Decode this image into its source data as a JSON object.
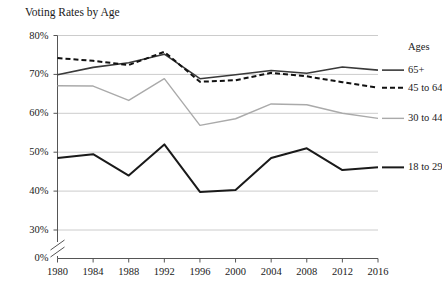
{
  "chart_data": {
    "type": "line",
    "title": "Voting Rates by Age",
    "xlabel": "",
    "ylabel": "",
    "x": [
      1980,
      1984,
      1988,
      1992,
      1996,
      2000,
      2004,
      2008,
      2012,
      2016
    ],
    "categories": [
      "1980",
      "1984",
      "1988",
      "1992",
      "1996",
      "2000",
      "2004",
      "2008",
      "2012",
      "2016"
    ],
    "xtick_labels": [
      "1980",
      "1984",
      "1988",
      "1992",
      "1996",
      "2000",
      "2004",
      "2008",
      "2012",
      "2016"
    ],
    "ytick_labels": [
      "0%",
      "30%",
      "40%",
      "50%",
      "60%",
      "70%",
      "80%"
    ],
    "ytick_values": [
      0,
      30,
      40,
      50,
      60,
      70,
      80
    ],
    "ylim": [
      30,
      80
    ],
    "xlim": [
      1980,
      2016
    ],
    "axis_break": true,
    "axis_break_note": "y-axis broken between 0% and 30%",
    "grid": "horizontal",
    "legend_position": "right",
    "legend_title": "Ages",
    "series": [
      {
        "name": "65+",
        "style": "solid",
        "color": "#3a3a3a",
        "values": [
          69.9,
          71.8,
          73.0,
          75.2,
          68.9,
          69.9,
          71.0,
          70.3,
          71.9,
          71.1
        ]
      },
      {
        "name": "45 to 64",
        "style": "dashed",
        "color": "#111111",
        "values": [
          74.2,
          73.5,
          72.4,
          75.8,
          68.1,
          68.5,
          70.4,
          69.5,
          68.0,
          66.6
        ]
      },
      {
        "name": "30 to 44",
        "style": "solid",
        "color": "#aaaaaa",
        "values": [
          67.1,
          67.0,
          63.3,
          68.9,
          56.9,
          58.6,
          62.4,
          62.2,
          60.0,
          58.7
        ]
      },
      {
        "name": "18 to 29",
        "style": "solid",
        "color": "#1a1a1a",
        "values": [
          48.5,
          49.5,
          44.0,
          52.0,
          39.8,
          40.3,
          48.5,
          51.0,
          45.4,
          46.1
        ]
      }
    ]
  },
  "legend": {
    "title": "Ages",
    "entries": [
      {
        "label": "65+"
      },
      {
        "label": "45 to 64"
      },
      {
        "label": "30 to 44"
      },
      {
        "label": "18 to 29"
      }
    ]
  },
  "colors": {
    "axis": "#555555",
    "grid": "#cccccc",
    "series_65_plus": "#3a3a3a",
    "series_45_64": "#111111",
    "series_30_44": "#aaaaaa",
    "series_18_29": "#1a1a1a",
    "background": "#ffffff"
  }
}
